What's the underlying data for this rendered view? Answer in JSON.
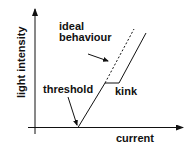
{
  "diagram": {
    "axes": {
      "x_label": "current",
      "y_label": "light intensity"
    },
    "annotations": {
      "ideal_line1": "ideal",
      "ideal_line2": "behaviour",
      "threshold": "threshold",
      "kink": "kink"
    },
    "colors": {
      "line": "#111111",
      "background": "#ffffff"
    }
  }
}
